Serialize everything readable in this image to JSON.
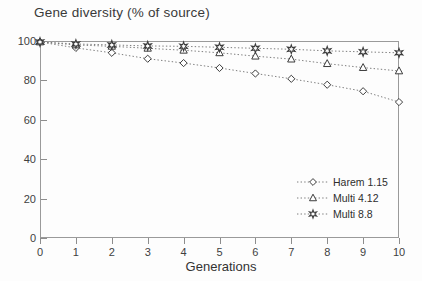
{
  "chart_data": {
    "type": "line",
    "title": "Gene diversity (% of source)",
    "xlabel": "Generations",
    "ylabel": "",
    "x": [
      0,
      1,
      2,
      3,
      4,
      5,
      6,
      7,
      8,
      9,
      10
    ],
    "xlim": [
      0,
      10
    ],
    "ylim": [
      0,
      100
    ],
    "xticks": [
      "0",
      "1",
      "2",
      "3",
      "4",
      "5",
      "6",
      "7",
      "8",
      "9",
      "10"
    ],
    "yticks": [
      "0",
      "20",
      "40",
      "60",
      "80",
      "100"
    ],
    "grid": false,
    "legend_position": "lower-right",
    "series": [
      {
        "name": "Harem 1.15",
        "marker": "diamond",
        "values": [
          99.5,
          96.5,
          94.0,
          91.0,
          88.8,
          86.3,
          83.5,
          80.8,
          77.8,
          74.5,
          69.0
        ]
      },
      {
        "name": "Multi 4.12",
        "marker": "triangle",
        "values": [
          99.5,
          98.0,
          97.3,
          96.3,
          95.3,
          94.0,
          92.3,
          90.8,
          88.5,
          86.5,
          84.8
        ]
      },
      {
        "name": "Multi 8.8",
        "marker": "star",
        "values": [
          99.5,
          98.5,
          98.0,
          97.5,
          97.3,
          96.8,
          96.3,
          95.8,
          95.0,
          94.5,
          94.0
        ]
      }
    ]
  },
  "legend": {
    "items": [
      {
        "label": "Harem 1.15",
        "marker": "diamond"
      },
      {
        "label": "Multi 4.12",
        "marker": "triangle"
      },
      {
        "label": "Multi 8.8",
        "marker": "star"
      }
    ]
  },
  "colors": {
    "axis": "#9a9a9a",
    "text": "#333333",
    "series_line": "#6e6e6e",
    "marker_stroke": "#3c3c3c"
  }
}
